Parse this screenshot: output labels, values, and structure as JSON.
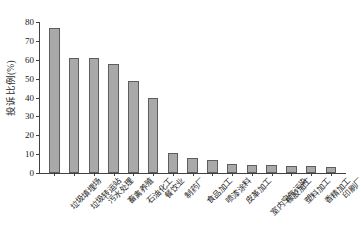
{
  "chart_data": {
    "type": "bar",
    "title": "",
    "xlabel": "",
    "ylabel": "投诉比例(%)",
    "ylim": [
      0,
      80
    ],
    "ytick_step": 10,
    "yticks": [
      0,
      10,
      20,
      30,
      40,
      50,
      60,
      70,
      80
    ],
    "grid": false,
    "legend": "none",
    "bar_color": "#a9a9a9",
    "bar_edge_color": "#5e5e5e",
    "axis_color": "#404040",
    "categories": [
      "垃圾填埋场",
      "垃圾转运站",
      "污水处理",
      "畜禽养殖",
      "石油化工",
      "餐饮业",
      "制药厂",
      "食品加工",
      "喷漆涂料",
      "皮革加工",
      "室内空气污染",
      "橡胶加工",
      "塑料加工",
      "香精加工",
      "印刷厂"
    ],
    "values": [
      77,
      61,
      61,
      58,
      49,
      40,
      10.5,
      8,
      7,
      5,
      4.5,
      4,
      3.8,
      3.5,
      3.2
    ]
  }
}
